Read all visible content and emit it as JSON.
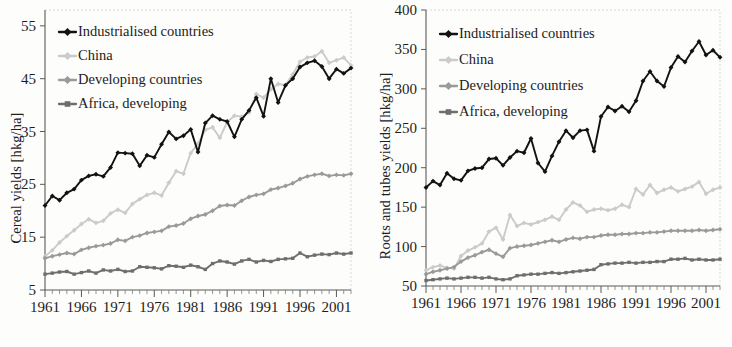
{
  "figure": {
    "panels": [
      {
        "id": "cereal",
        "ylabel": "Cereal yields [hkg/ha]",
        "yticks": [
          "5",
          "15",
          "25",
          "35",
          "45",
          "55"
        ],
        "xticks": [
          "1961",
          "1966",
          "1971",
          "1976",
          "1981",
          "1986",
          "1991",
          "1996",
          "2001"
        ]
      },
      {
        "id": "roots",
        "ylabel": "Roots and tubes yields [hkg/ha]",
        "yticks": [
          "50",
          "100",
          "150",
          "200",
          "250",
          "300",
          "350",
          "400"
        ],
        "xticks": [
          "1961",
          "1966",
          "1971",
          "1976",
          "1981",
          "1986",
          "1991",
          "1996",
          "2001"
        ]
      }
    ],
    "legend": {
      "industrialised": "Industrialised countries",
      "china": "China",
      "developing": "Developing countries",
      "africa": "Africa, developing"
    },
    "colors": {
      "industrialised": "#121212",
      "china": "#cbcbcb",
      "developing": "#9a9a9a",
      "africa": "#6e6e6e",
      "axis": "#5a5a58",
      "background": "#fdfdfc"
    }
  },
  "chart_data": [
    {
      "type": "line",
      "title": "",
      "xlabel": "",
      "ylabel": "Cereal yields [hkg/ha]",
      "xlim": [
        1961,
        2003
      ],
      "ylim": [
        5,
        58
      ],
      "ytick_values": [
        5,
        15,
        25,
        35,
        45,
        55
      ],
      "xtick_values": [
        1961,
        1966,
        1971,
        1976,
        1981,
        1986,
        1991,
        1996,
        2001
      ],
      "grid": false,
      "legend_position": "upper-left",
      "x": [
        1961,
        1962,
        1963,
        1964,
        1965,
        1966,
        1967,
        1968,
        1969,
        1970,
        1971,
        1972,
        1973,
        1974,
        1975,
        1976,
        1977,
        1978,
        1979,
        1980,
        1981,
        1982,
        1983,
        1984,
        1985,
        1986,
        1987,
        1988,
        1989,
        1990,
        1991,
        1992,
        1993,
        1994,
        1995,
        1996,
        1997,
        1998,
        1999,
        2000,
        2001,
        2002,
        2003
      ],
      "series": [
        {
          "name": "Industrialised countries",
          "color": "#121212",
          "marker": "diamond",
          "values": [
            21.0,
            22.8,
            22.0,
            23.4,
            24.1,
            25.8,
            26.6,
            26.9,
            26.5,
            28.2,
            31.0,
            30.9,
            30.8,
            28.5,
            30.5,
            30.1,
            32.6,
            34.9,
            33.6,
            34.2,
            35.4,
            31.1,
            36.6,
            38.0,
            37.3,
            36.9,
            34.0,
            37.3,
            39.0,
            41.4,
            37.9,
            45.0,
            40.5,
            43.7,
            45.0,
            47.2,
            48.0,
            48.4,
            47.3,
            45.0,
            46.8,
            46.0,
            47.0
          ]
        },
        {
          "name": "China",
          "color": "#cbcbcb",
          "marker": "diamond",
          "values": [
            11.4,
            12.5,
            14.0,
            15.2,
            16.3,
            17.5,
            18.4,
            17.7,
            18.1,
            19.5,
            20.2,
            19.6,
            21.3,
            22.2,
            23.0,
            23.4,
            22.9,
            25.3,
            27.5,
            27.0,
            30.9,
            32.7,
            35.3,
            35.8,
            33.8,
            36.8,
            38.0,
            37.8,
            38.6,
            42.1,
            41.4,
            43.0,
            44.0,
            43.8,
            45.8,
            48.2,
            49.0,
            49.2,
            50.2,
            48.0,
            48.5,
            49.0,
            47.5
          ]
        },
        {
          "name": "Developing countries",
          "color": "#9a9a9a",
          "marker": "diamond",
          "values": [
            11.0,
            11.4,
            11.7,
            12.0,
            11.8,
            12.6,
            13.0,
            13.3,
            13.5,
            13.8,
            14.5,
            14.3,
            15.0,
            15.3,
            15.8,
            16.0,
            16.2,
            17.0,
            17.2,
            17.6,
            18.5,
            19.0,
            19.3,
            20.0,
            20.9,
            21.1,
            21.0,
            21.9,
            22.6,
            23.0,
            23.2,
            24.0,
            24.3,
            24.7,
            25.2,
            26.0,
            26.5,
            26.8,
            27.0,
            26.6,
            26.8,
            26.7,
            27.0
          ]
        },
        {
          "name": "Africa, developing",
          "color": "#6e6e6e",
          "marker": "square",
          "values": [
            8.0,
            8.2,
            8.4,
            8.5,
            8.0,
            8.3,
            8.6,
            8.2,
            8.8,
            8.6,
            8.9,
            8.5,
            8.6,
            9.4,
            9.3,
            9.2,
            9.0,
            9.6,
            9.5,
            9.3,
            9.7,
            9.4,
            8.9,
            10.0,
            10.5,
            10.3,
            9.9,
            10.5,
            10.8,
            10.3,
            10.6,
            10.4,
            10.8,
            10.9,
            11.0,
            12.0,
            11.3,
            11.6,
            11.8,
            11.7,
            12.0,
            11.8,
            12.0
          ]
        }
      ]
    },
    {
      "type": "line",
      "title": "",
      "xlabel": "",
      "ylabel": "Roots and tubes yields [hkg/ha]",
      "xlim": [
        1961,
        2003
      ],
      "ylim": [
        50,
        400
      ],
      "ytick_values": [
        50,
        100,
        150,
        200,
        250,
        300,
        350,
        400
      ],
      "xtick_values": [
        1961,
        1966,
        1971,
        1976,
        1981,
        1986,
        1991,
        1996,
        2001
      ],
      "grid": false,
      "legend_position": "upper-left",
      "x": [
        1961,
        1962,
        1963,
        1964,
        1965,
        1966,
        1967,
        1968,
        1969,
        1970,
        1971,
        1972,
        1973,
        1974,
        1975,
        1976,
        1977,
        1978,
        1979,
        1980,
        1981,
        1982,
        1983,
        1984,
        1985,
        1986,
        1987,
        1988,
        1989,
        1990,
        1991,
        1992,
        1993,
        1994,
        1995,
        1996,
        1997,
        1998,
        1999,
        2000,
        2001,
        2002,
        2003
      ],
      "series": [
        {
          "name": "Industrialised countries",
          "color": "#121212",
          "marker": "diamond",
          "values": [
            175,
            183,
            178,
            193,
            186,
            184,
            196,
            199,
            200,
            211,
            212,
            203,
            213,
            221,
            219,
            237,
            206,
            195,
            215,
            233,
            247,
            238,
            247,
            248,
            221,
            265,
            277,
            272,
            278,
            271,
            285,
            310,
            322,
            310,
            303,
            327,
            341,
            334,
            348,
            360,
            343,
            349,
            340
          ]
        },
        {
          "name": "China",
          "color": "#cbcbcb",
          "marker": "diamond",
          "values": [
            70,
            74,
            76,
            73,
            72,
            88,
            95,
            99,
            104,
            119,
            124,
            109,
            140,
            126,
            130,
            128,
            131,
            134,
            138,
            134,
            147,
            156,
            152,
            144,
            147,
            148,
            146,
            148,
            153,
            150,
            173,
            166,
            178,
            168,
            172,
            175,
            170,
            173,
            176,
            182,
            167,
            172,
            175
          ]
        },
        {
          "name": "Developing countries",
          "color": "#9a9a9a",
          "marker": "diamond",
          "values": [
            65,
            68,
            70,
            72,
            74,
            81,
            86,
            89,
            93,
            96,
            91,
            87,
            98,
            100,
            101,
            102,
            104,
            106,
            108,
            106,
            109,
            111,
            110,
            112,
            112,
            114,
            115,
            115,
            116,
            116,
            117,
            117,
            118,
            118,
            119,
            120,
            120,
            120,
            120,
            121,
            120,
            121,
            122
          ]
        },
        {
          "name": "Africa, developing",
          "color": "#6e6e6e",
          "marker": "square",
          "values": [
            57,
            58,
            59,
            60,
            59,
            60,
            61,
            61,
            60,
            61,
            59,
            58,
            59,
            63,
            64,
            65,
            65,
            66,
            67,
            66,
            67,
            68,
            69,
            70,
            71,
            77,
            78,
            79,
            79,
            80,
            79,
            80,
            80,
            81,
            81,
            84,
            84,
            85,
            83,
            84,
            83,
            83,
            84
          ]
        }
      ]
    }
  ]
}
